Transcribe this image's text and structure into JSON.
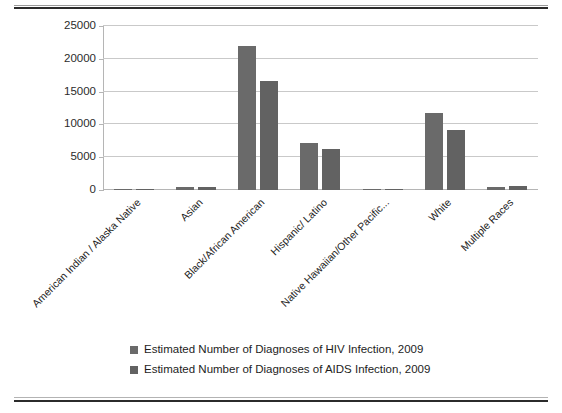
{
  "figure": {
    "background_color": "#ffffff",
    "bar_color_series1": "#6a6a6a",
    "bar_color_series2": "#626262",
    "gridline_color": "#c9c9c9",
    "rule_color": "#2b2b2b"
  },
  "chart_data": {
    "type": "bar",
    "title": "",
    "xlabel": "",
    "ylabel": "",
    "ylim": [
      0,
      25000
    ],
    "yticks": [
      0,
      5000,
      10000,
      15000,
      20000,
      25000
    ],
    "ytick_labels": [
      "0",
      "5000",
      "10000",
      "15000",
      "20000",
      "25000"
    ],
    "grid": true,
    "legend_position": "bottom",
    "categories": [
      "American Indian / Alaska Native",
      "Asian",
      "Black/African American",
      "Hispanic/ Latino",
      "Native Hawaiian/Other Pacific...",
      "White",
      "Multiple Races"
    ],
    "series": [
      {
        "name": "Estimated Number of Diagnoses of HIV Infection, 2009",
        "color": "#6a6a6a",
        "values": [
          200,
          500,
          21900,
          7200,
          60,
          11700,
          400
        ]
      },
      {
        "name": "Estimated Number of Diagnoses of AIDS Infection, 2009",
        "color": "#626262",
        "values": [
          150,
          400,
          16600,
          6300,
          50,
          9100,
          550
        ]
      }
    ]
  },
  "legend": {
    "entries": [
      "Estimated Number of Diagnoses of HIV Infection, 2009",
      "Estimated Number of Diagnoses of AIDS Infection, 2009"
    ]
  }
}
